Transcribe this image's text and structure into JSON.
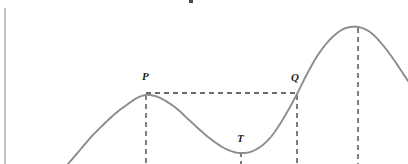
{
  "figure": {
    "background_color": "#ffffff",
    "curve_color": "#8c8c8c",
    "axis_color": "#a8a8a8",
    "dash_color": "#3a3a3a",
    "label_color": "#232323",
    "width": 408,
    "height": 164,
    "caption_fragment": ""
  },
  "axes": {
    "y_axis": {
      "name": "y-axis",
      "x": 5,
      "y_top": 8,
      "y_bottom": 164
    },
    "x_axis_visible": false
  },
  "labels": {
    "p": "P",
    "q": "Q",
    "t": "T"
  },
  "chart_data": {
    "type": "line",
    "title": "",
    "xlabel": "",
    "ylabel": "",
    "grid": false,
    "legend": null,
    "xlim": [
      0,
      408
    ],
    "ylim": [
      164,
      0
    ],
    "annotations": [
      {
        "label": "P",
        "role": "local-maximum",
        "x": 146,
        "y": 95,
        "label_x": 142,
        "label_y": 78
      },
      {
        "label": "T",
        "role": "local-minimum",
        "x": 241,
        "y": 153,
        "label_x": 237,
        "label_y": 140
      },
      {
        "label": "Q",
        "role": "equal-height-crossing",
        "x": 297,
        "y": 94,
        "label_x": 292,
        "label_y": 79
      },
      {
        "label": "",
        "role": "global-maximum",
        "x": 358,
        "y": 27,
        "label_x": 358,
        "label_y": 27
      }
    ],
    "points": [
      [
        68,
        164
      ],
      [
        80,
        150
      ],
      [
        92,
        136
      ],
      [
        104,
        124
      ],
      [
        116,
        113
      ],
      [
        128,
        104
      ],
      [
        137,
        98
      ],
      [
        146,
        95
      ],
      [
        155,
        96
      ],
      [
        164,
        100
      ],
      [
        176,
        108
      ],
      [
        188,
        119
      ],
      [
        200,
        130
      ],
      [
        212,
        140
      ],
      [
        224,
        148
      ],
      [
        234,
        152
      ],
      [
        241,
        153
      ],
      [
        250,
        152
      ],
      [
        260,
        147
      ],
      [
        270,
        138
      ],
      [
        280,
        124
      ],
      [
        290,
        107
      ],
      [
        297,
        94
      ],
      [
        306,
        76
      ],
      [
        316,
        58
      ],
      [
        326,
        44
      ],
      [
        336,
        34
      ],
      [
        346,
        28
      ],
      [
        358,
        27
      ],
      [
        370,
        32
      ],
      [
        382,
        44
      ],
      [
        394,
        60
      ],
      [
        408,
        81
      ]
    ],
    "dashed_segments": [
      {
        "name": "pq-level-line",
        "orientation": "horizontal",
        "x1": 146,
        "y1": 93,
        "x2": 297,
        "y2": 93
      },
      {
        "name": "p-drop-line",
        "orientation": "vertical",
        "x1": 146,
        "y1": 95,
        "x2": 146,
        "y2": 164
      },
      {
        "name": "t-drop-line",
        "orientation": "vertical",
        "x1": 241,
        "y1": 153,
        "x2": 241,
        "y2": 164
      },
      {
        "name": "q-drop-line",
        "orientation": "vertical",
        "x1": 297,
        "y1": 95,
        "x2": 297,
        "y2": 164
      },
      {
        "name": "peak-drop-line",
        "orientation": "vertical",
        "x1": 358,
        "y1": 27,
        "x2": 358,
        "y2": 164
      }
    ]
  }
}
